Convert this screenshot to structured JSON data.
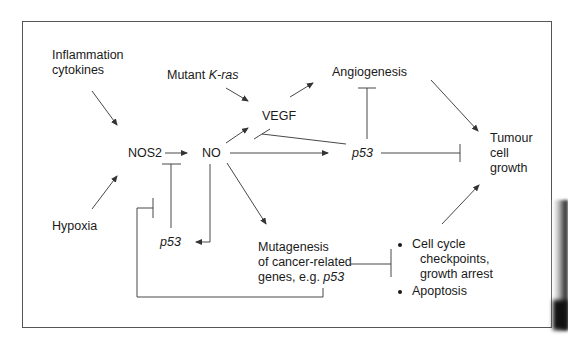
{
  "diagram": {
    "nodes": {
      "inflammation": {
        "line1": "Inflammation",
        "line2": "cytokines"
      },
      "mutant_kras": {
        "prefix": "Mutant ",
        "gene": "K-ras"
      },
      "angiogenesis": "Angiogenesis",
      "vegf": "VEGF",
      "nos2": "NOS2",
      "no": "NO",
      "p53_center": "p53",
      "tumour": {
        "line1": "Tumour",
        "line2": "cell",
        "line3": "growth"
      },
      "hypoxia": "Hypoxia",
      "p53_lower": "p53",
      "mutagenesis": {
        "line1": "Mutagenesis",
        "line2": "of cancer-related",
        "line3_prefix": "genes, e.g. ",
        "line3_gene": "p53"
      },
      "outcomes": {
        "item1_line1": "Cell cycle",
        "item1_line2": "checkpoints,",
        "item1_line3": "growth arrest",
        "item2": "Apoptosis"
      }
    },
    "edges": [
      {
        "from": "Inflammation cytokines",
        "to": "NOS2",
        "type": "activation"
      },
      {
        "from": "Hypoxia",
        "to": "NOS2",
        "type": "activation"
      },
      {
        "from": "NOS2",
        "to": "NO",
        "type": "activation"
      },
      {
        "from": "p53 (lower)",
        "to": "NOS2",
        "type": "inhibition"
      },
      {
        "from": "NO",
        "to": "p53 (lower)",
        "type": "activation"
      },
      {
        "from": "NO",
        "to": "VEGF",
        "type": "activation"
      },
      {
        "from": "Mutant K-ras",
        "to": "VEGF",
        "type": "activation"
      },
      {
        "from": "p53 (center)",
        "to": "VEGF",
        "type": "inhibition"
      },
      {
        "from": "VEGF",
        "to": "Angiogenesis",
        "type": "activation"
      },
      {
        "from": "p53 (center)",
        "to": "Angiogenesis",
        "type": "inhibition"
      },
      {
        "from": "NO",
        "to": "p53 (center)",
        "type": "activation"
      },
      {
        "from": "p53 (center)",
        "to": "Tumour cell growth",
        "type": "inhibition"
      },
      {
        "from": "Angiogenesis",
        "to": "Tumour cell growth",
        "type": "activation"
      },
      {
        "from": "NO",
        "to": "Mutagenesis",
        "type": "activation"
      },
      {
        "from": "Mutagenesis",
        "to": "Cell cycle checkpoints / Apoptosis",
        "type": "inhibition"
      },
      {
        "from": "Cell cycle checkpoints / Apoptosis",
        "to": "Tumour cell growth",
        "type": "activation"
      },
      {
        "from": "Mutagenesis",
        "to": "NOS2 (feedback)",
        "type": "inhibition"
      }
    ],
    "colors": {
      "line": "#333333",
      "text": "#1a1a1a",
      "frame": "#555555"
    }
  }
}
